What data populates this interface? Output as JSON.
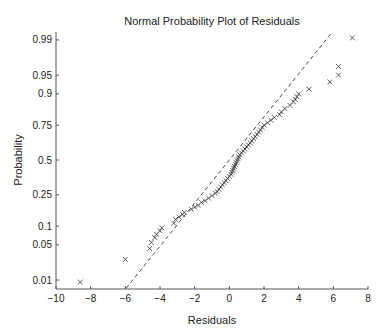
{
  "chart_data": {
    "type": "scatter",
    "title": "Normal Probability Plot of Residuals",
    "xlabel": "Residuals",
    "ylabel": "Probability",
    "xlim": [
      -10,
      8
    ],
    "xticks": [
      -10,
      -8,
      -6,
      -4,
      -2,
      0,
      2,
      4,
      6,
      8
    ],
    "yticks": [
      0.01,
      0.05,
      0.1,
      0.25,
      0.5,
      0.75,
      0.9,
      0.95,
      0.99
    ],
    "ytick_labels": [
      "0.01",
      "0.05",
      "0.1",
      "0.25",
      "0.5",
      "0.75",
      "0.9",
      "0.95",
      "0.99"
    ],
    "grid": false,
    "marker": "x",
    "colors": {
      "marker": "#333333",
      "line": "#333333",
      "axis": "#555555",
      "text": "#222222"
    },
    "reference_line": {
      "style": "dashed",
      "from": [
        -5.95,
        0.0065
      ],
      "to": [
        5.95,
        0.9935
      ]
    },
    "series": [
      {
        "name": "Residuals",
        "points": [
          [
            -8.6,
            0.009
          ],
          [
            -6.0,
            0.027
          ],
          [
            -4.6,
            0.043
          ],
          [
            -4.5,
            0.055
          ],
          [
            -4.3,
            0.066
          ],
          [
            -4.2,
            0.075
          ],
          [
            -4.0,
            0.085
          ],
          [
            -3.9,
            0.094
          ],
          [
            -3.2,
            0.11
          ],
          [
            -3.1,
            0.125
          ],
          [
            -2.9,
            0.135
          ],
          [
            -2.7,
            0.145
          ],
          [
            -2.6,
            0.155
          ],
          [
            -2.2,
            0.17
          ],
          [
            -2.0,
            0.18
          ],
          [
            -1.8,
            0.19
          ],
          [
            -1.6,
            0.205
          ],
          [
            -1.4,
            0.215
          ],
          [
            -1.2,
            0.23
          ],
          [
            -1.0,
            0.245
          ],
          [
            -0.8,
            0.26
          ],
          [
            -0.7,
            0.27
          ],
          [
            -0.6,
            0.285
          ],
          [
            -0.5,
            0.3
          ],
          [
            -0.4,
            0.315
          ],
          [
            -0.3,
            0.33
          ],
          [
            -0.2,
            0.345
          ],
          [
            -0.1,
            0.36
          ],
          [
            0.0,
            0.375
          ],
          [
            0.1,
            0.39
          ],
          [
            0.15,
            0.405
          ],
          [
            0.2,
            0.42
          ],
          [
            0.25,
            0.435
          ],
          [
            0.3,
            0.45
          ],
          [
            0.35,
            0.465
          ],
          [
            0.4,
            0.48
          ],
          [
            0.45,
            0.495
          ],
          [
            0.5,
            0.51
          ],
          [
            0.55,
            0.525
          ],
          [
            0.6,
            0.54
          ],
          [
            0.7,
            0.555
          ],
          [
            0.8,
            0.57
          ],
          [
            0.9,
            0.585
          ],
          [
            1.0,
            0.6
          ],
          [
            1.1,
            0.615
          ],
          [
            1.2,
            0.63
          ],
          [
            1.3,
            0.645
          ],
          [
            1.4,
            0.66
          ],
          [
            1.5,
            0.675
          ],
          [
            1.6,
            0.69
          ],
          [
            1.7,
            0.705
          ],
          [
            1.8,
            0.72
          ],
          [
            1.9,
            0.735
          ],
          [
            2.0,
            0.75
          ],
          [
            2.2,
            0.765
          ],
          [
            2.4,
            0.78
          ],
          [
            2.6,
            0.795
          ],
          [
            2.9,
            0.81
          ],
          [
            3.0,
            0.825
          ],
          [
            3.2,
            0.84
          ],
          [
            3.5,
            0.855
          ],
          [
            3.7,
            0.87
          ],
          [
            3.8,
            0.88
          ],
          [
            3.9,
            0.89
          ],
          [
            4.0,
            0.9
          ],
          [
            4.6,
            0.915
          ],
          [
            5.8,
            0.935
          ],
          [
            6.3,
            0.95
          ],
          [
            6.3,
            0.965
          ],
          [
            7.1,
            0.991
          ]
        ]
      }
    ]
  }
}
